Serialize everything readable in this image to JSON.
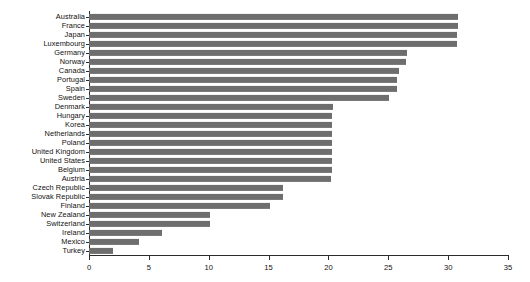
{
  "chart_data": {
    "type": "bar",
    "orientation": "horizontal",
    "title": "",
    "subtitle": "",
    "xlabel": "",
    "ylabel": "",
    "xlim": [
      0,
      35
    ],
    "xticks": [
      0,
      5,
      10,
      15,
      20,
      25,
      30,
      35
    ],
    "xtick_labels": [
      "0",
      "5",
      "10",
      "15",
      "20",
      "25",
      "30",
      "35"
    ],
    "grid": false,
    "legend": false,
    "legend_position": "none",
    "bar_color": "#6e6e6e",
    "axis_color": "#2b2b2b",
    "categories": [
      "Australia",
      "France",
      "Japan",
      "Luxembourg",
      "Germany",
      "Norway",
      "Canada",
      "Portugal",
      "Spain",
      "Sweden",
      "Denmark",
      "Hungary",
      "Korea",
      "Netherlands",
      "Poland",
      "United Kingdom",
      "United States",
      "Belgium",
      "Austria",
      "Czech Republic",
      "Slovak Republic",
      "Finland",
      "New Zealand",
      "Switzerland",
      "Ireland",
      "Mexico",
      "Turkey"
    ],
    "values": [
      30.8,
      30.8,
      30.7,
      30.7,
      26.6,
      26.5,
      25.9,
      25.7,
      25.7,
      25.1,
      20.4,
      20.3,
      20.3,
      20.3,
      20.3,
      20.3,
      20.3,
      20.3,
      20.2,
      16.2,
      16.2,
      15.1,
      10.1,
      10.1,
      6.1,
      4.2,
      2.0
    ]
  }
}
